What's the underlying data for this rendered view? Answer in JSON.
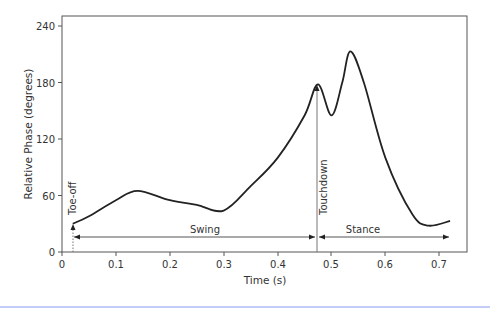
{
  "chart_data": {
    "type": "line",
    "title": "",
    "xlabel": "Time (s)",
    "ylabel": "Relative Phase (degrees)",
    "xlim": [
      0,
      0.75
    ],
    "ylim": [
      0,
      250
    ],
    "x_ticks": [
      "0",
      "0.1",
      "0.2",
      "0.3",
      "0.4",
      "0.5",
      "0.6",
      "0.7"
    ],
    "y_ticks": [
      "0",
      "60",
      "120",
      "180",
      "240"
    ],
    "grid": false,
    "series": [
      {
        "name": "Relative Phase",
        "x": [
          0.02,
          0.05,
          0.1,
          0.14,
          0.2,
          0.25,
          0.3,
          0.35,
          0.4,
          0.45,
          0.475,
          0.5,
          0.52,
          0.535,
          0.56,
          0.6,
          0.65,
          0.68,
          0.72
        ],
        "y": [
          30,
          38,
          55,
          65,
          55,
          50,
          44,
          70,
          100,
          145,
          178,
          145,
          180,
          213,
          180,
          100,
          40,
          28,
          33
        ]
      }
    ],
    "annotations": [
      {
        "text": "Toe-off",
        "x": 0.02,
        "orientation": "vertical"
      },
      {
        "text": "Touchdown",
        "x": 0.475,
        "orientation": "vertical"
      },
      {
        "text": "Swing",
        "from": 0.02,
        "to": 0.475
      },
      {
        "text": "Stance",
        "from": 0.475,
        "to": 0.72
      }
    ]
  }
}
